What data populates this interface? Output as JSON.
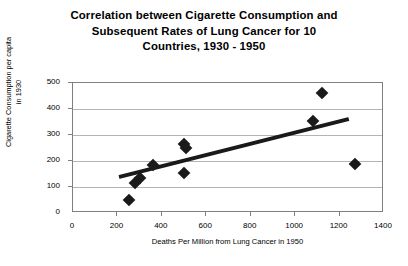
{
  "chart_data": {
    "type": "scatter",
    "title_lines": [
      "Correlation between Cigarette Consumption and",
      "Subsequent Rates of Lung Cancer for 10",
      "Countries, 1930 - 1950"
    ],
    "title": "Correlation between Cigarette Consumption and Subsequent Rates of Lung Cancer for 10 Countries, 1930 - 1950",
    "xlabel": "Deaths Per Million from Lung Cancer in 1950",
    "ylabel_lines": [
      "Cigarette Consumption per capita",
      "in 1930"
    ],
    "ylabel": "Cigarette Consumption per capita in 1930",
    "xlim": [
      0,
      1400
    ],
    "ylim": [
      0,
      500
    ],
    "xticks": [
      0,
      200,
      400,
      600,
      800,
      1000,
      1200,
      1400
    ],
    "yticks": [
      0,
      100,
      200,
      300,
      400,
      500
    ],
    "grid": true,
    "legend": "none",
    "marker_shape": "diamond",
    "marker_color": "#1a1a1a",
    "points": [
      {
        "x": 250,
        "y": 50
      },
      {
        "x": 280,
        "y": 115
      },
      {
        "x": 300,
        "y": 135
      },
      {
        "x": 360,
        "y": 185
      },
      {
        "x": 500,
        "y": 265
      },
      {
        "x": 510,
        "y": 250
      },
      {
        "x": 500,
        "y": 155
      },
      {
        "x": 1080,
        "y": 355
      },
      {
        "x": 1120,
        "y": 460
      },
      {
        "x": 1270,
        "y": 190
      }
    ],
    "trendline": {
      "type": "linear",
      "color": "#1a1a1a",
      "x_start": 207,
      "y_start": 139,
      "x_end": 1242,
      "y_end": 362
    }
  }
}
